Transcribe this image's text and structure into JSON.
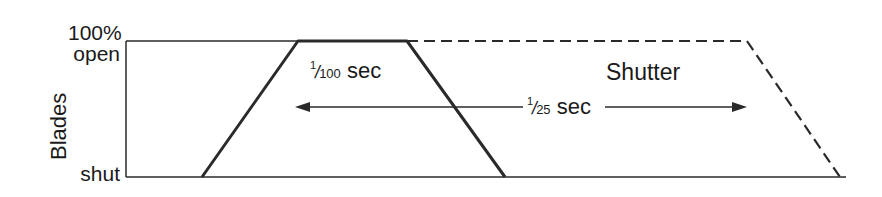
{
  "diagram": {
    "y_axis": {
      "title": "Blades",
      "top_label_line1": "100%",
      "top_label_line2": "open",
      "bottom_label": "shut"
    },
    "blade_curve": {
      "style": "solid",
      "label_numerator": "1",
      "label_denominator": "100",
      "label_unit": "sec",
      "points": [
        [
          202,
          177
        ],
        [
          298,
          41
        ],
        [
          407,
          41
        ],
        [
          505,
          177
        ]
      ]
    },
    "shutter_curve": {
      "style": "dashed",
      "label": "Shutter",
      "points": [
        [
          407,
          41
        ],
        [
          747,
          41
        ],
        [
          840,
          177
        ]
      ]
    },
    "interval_arrow": {
      "label_numerator": "1",
      "label_denominator": "25",
      "label_unit": "sec",
      "x_start": 295,
      "x_end": 747,
      "y": 107
    },
    "colors": {
      "line": "#2a2a2a",
      "background": "#ffffff"
    }
  }
}
